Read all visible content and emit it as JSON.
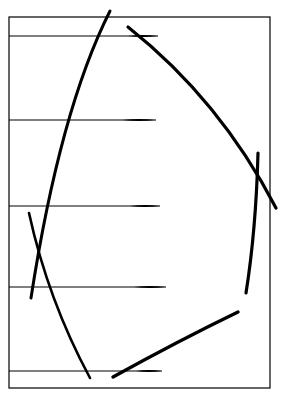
{
  "canvas": {
    "width": 282,
    "height": 395,
    "background": "#ffffff",
    "ink": "#000000"
  },
  "frame": {
    "x": 9,
    "y": 17,
    "width": 261,
    "height": 371,
    "stroke_width": 1.2
  },
  "horizontal_lines": [
    {
      "y": 36,
      "x1": 9,
      "x2": 158,
      "tail_x1": 128
    },
    {
      "y": 120,
      "x1": 9,
      "x2": 156,
      "tail_x1": 122
    },
    {
      "y": 206,
      "x1": 9,
      "x2": 160,
      "tail_x1": 130
    },
    {
      "y": 287,
      "x1": 9,
      "x2": 166,
      "tail_x1": 134
    },
    {
      "y": 371,
      "x1": 9,
      "x2": 162,
      "tail_x1": 136
    }
  ],
  "strokes": [
    {
      "name": "left-arc-stroke",
      "d": "M 110 11 Q 60 110 31 298",
      "width": 3
    },
    {
      "name": "top-right-diagonal-stroke",
      "d": "M 128 27 Q 220 100 276 208",
      "width": 3.2
    },
    {
      "name": "right-vertical-stroke",
      "d": "M 258 153 Q 256 230 246 293",
      "width": 3.2
    },
    {
      "name": "bottom-left-diagonal-stroke",
      "d": "M 29 213 Q 48 300 90 378",
      "width": 2.6
    },
    {
      "name": "bottom-right-diagonal-stroke",
      "d": "M 113 377 Q 180 340 238 312",
      "width": 3.4
    }
  ]
}
